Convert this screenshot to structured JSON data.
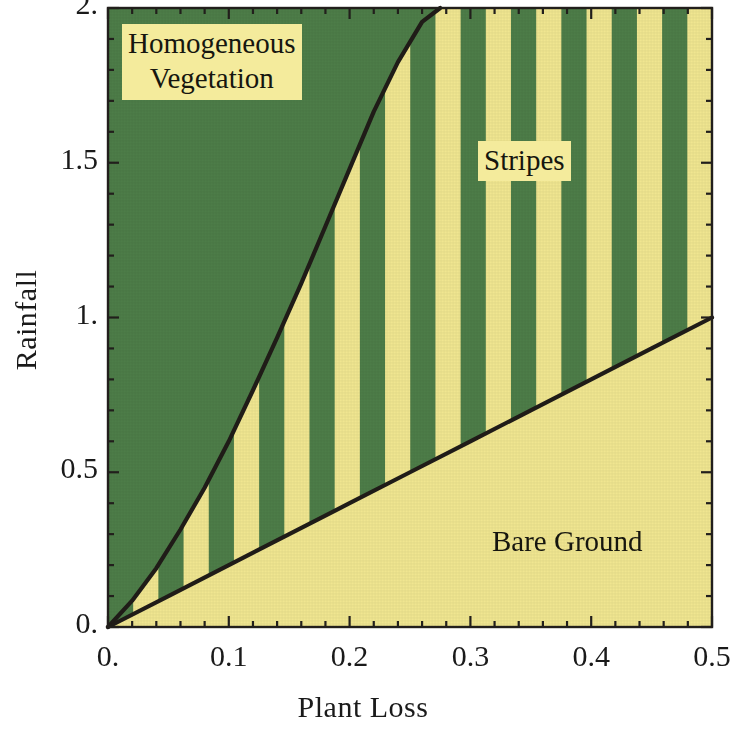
{
  "figure": {
    "type": "phase-diagram",
    "background_color": "#ffffff"
  },
  "axes": {
    "xlabel": "Plant Loss",
    "ylabel": "Rainfall",
    "xlim": [
      0.0,
      0.5
    ],
    "ylim": [
      0.0,
      2.0
    ],
    "xticks": [
      "0.",
      "0.1",
      "0.2",
      "0.3",
      "0.4",
      "0.5"
    ],
    "xtick_values": [
      0.0,
      0.1,
      0.2,
      0.3,
      0.4,
      0.5
    ],
    "yticks": [
      "0.",
      "0.5",
      "1.",
      "1.5",
      "2."
    ],
    "ytick_values": [
      0.0,
      0.5,
      1.0,
      1.5,
      2.0
    ],
    "xminor_count": 4,
    "yminor_count": 4,
    "frame": true,
    "grid": false,
    "frame_color": "#221f1c",
    "tick_color": "#221f1c"
  },
  "colors": {
    "vegetation_green": "#4d7d48",
    "bare_yellow": "#f0e690",
    "curve_black": "#201c18",
    "label_box": "#f4eb9c",
    "text": "#16160f"
  },
  "regions": [
    {
      "name": "homogeneous-vegetation",
      "label": "Homogeneous\nVegetation",
      "fill": "#4d7d48",
      "label_x": 0.022,
      "label_y": 1.96
    },
    {
      "name": "stripes",
      "label": "Stripes",
      "fill": "striped-green-yellow",
      "label_x": 0.3,
      "label_y": 1.58
    },
    {
      "name": "bare-ground",
      "label": "Bare Ground",
      "fill": "#f0e690",
      "label_x": 0.33,
      "label_y": 0.32
    }
  ],
  "chart_data": {
    "type": "area",
    "title": "",
    "xlabel": "Plant Loss",
    "ylabel": "Rainfall",
    "xlim": [
      0.0,
      0.5
    ],
    "ylim": [
      0.0,
      2.0
    ],
    "grid": false,
    "legend": "none",
    "annotations": [
      {
        "text": "Homogeneous Vegetation",
        "x": 0.045,
        "y": 1.85
      },
      {
        "text": "Stripes",
        "x": 0.335,
        "y": 1.5
      },
      {
        "text": "Bare Ground",
        "x": 0.39,
        "y": 0.28
      }
    ],
    "series": [
      {
        "name": "Homogeneous / Stripes boundary",
        "type": "line",
        "color": "#201c18",
        "x": [
          0.0,
          0.02,
          0.04,
          0.06,
          0.08,
          0.1,
          0.12,
          0.14,
          0.16,
          0.18,
          0.2,
          0.22,
          0.24,
          0.26,
          0.275
        ],
        "y": [
          0.0,
          0.085,
          0.19,
          0.315,
          0.45,
          0.6,
          0.765,
          0.935,
          1.11,
          1.295,
          1.48,
          1.665,
          1.825,
          1.955,
          2.0
        ]
      },
      {
        "name": "Stripes / Bare Ground boundary",
        "type": "line",
        "color": "#201c18",
        "x": [
          0.0,
          0.05,
          0.1,
          0.15,
          0.2,
          0.25,
          0.3,
          0.35,
          0.4,
          0.45,
          0.5
        ],
        "y": [
          0.0,
          0.1,
          0.2,
          0.3,
          0.4,
          0.5,
          0.6,
          0.7,
          0.8,
          0.9,
          1.0
        ]
      }
    ],
    "stripe_pattern": {
      "orientation": "vertical",
      "period_x": 0.0417,
      "duty_cycle": 0.5,
      "colors": [
        "#4d7d48",
        "#f0e690"
      ]
    }
  }
}
